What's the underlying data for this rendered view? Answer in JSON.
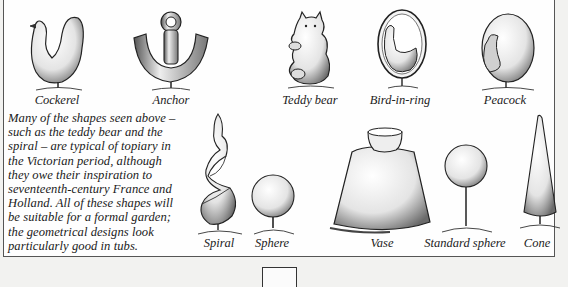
{
  "figures_top": [
    {
      "name": "Cockerel",
      "label_x": 57,
      "label_y": 94
    },
    {
      "name": "Anchor",
      "label_x": 171,
      "label_y": 94
    },
    {
      "name": "Teddy bear",
      "label_x": 310,
      "label_y": 94
    },
    {
      "name": "Bird-in-ring",
      "label_x": 400,
      "label_y": 94
    },
    {
      "name": "Peacock",
      "label_x": 505,
      "label_y": 94
    }
  ],
  "figures_bottom": [
    {
      "name": "Spiral",
      "label_x": 219,
      "label_y": 237
    },
    {
      "name": "Sphere",
      "label_x": 272,
      "label_y": 237
    },
    {
      "name": "Vase",
      "label_x": 382,
      "label_y": 237
    },
    {
      "name": "Standard sphere",
      "label_x": 465,
      "label_y": 237
    },
    {
      "name": "Cone",
      "label_x": 537,
      "label_y": 237
    }
  ],
  "caption": {
    "lines": [
      "Many of the shapes seen above –",
      "such as the teddy bear and the",
      "spiral – are typical of topiary in",
      "the Victorian period, although",
      "they owe their inspiration to",
      "seventeenth-century France and",
      "Holland. All of these shapes will",
      "be suitable for a formal garden;",
      "the geometrical designs look",
      "particularly good in tubs."
    ]
  },
  "colors": {
    "ink": "#1a1a1a",
    "panel": "#fefefe",
    "page": "#f2f2f0",
    "border": "#555555"
  }
}
